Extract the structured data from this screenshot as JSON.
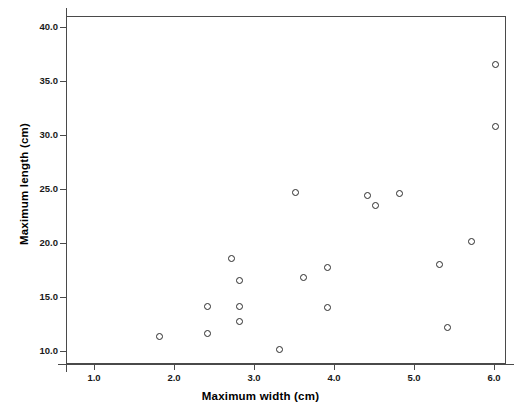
{
  "chart_data": {
    "type": "scatter",
    "title": "",
    "xlabel": "Maximum width (cm)",
    "ylabel": "Maximum length (cm)",
    "xlim": [
      0.65,
      6.15
    ],
    "ylim": [
      8.8,
      41.0
    ],
    "xticks": [
      "1.0",
      "2.0",
      "3.0",
      "4.0",
      "5.0",
      "6.0"
    ],
    "xtick_values": [
      1.0,
      2.0,
      3.0,
      4.0,
      5.0,
      6.0
    ],
    "yticks": [
      "10.0",
      "15.0",
      "20.0",
      "25.0",
      "30.0",
      "35.0",
      "40.0"
    ],
    "ytick_values": [
      10.0,
      15.0,
      20.0,
      25.0,
      30.0,
      35.0,
      40.0
    ],
    "grid": false,
    "legend": null,
    "marker": "open-circle",
    "marker_color": "#2b2b2b",
    "points": [
      {
        "x": 1.8,
        "y": 11.4
      },
      {
        "x": 2.4,
        "y": 14.2
      },
      {
        "x": 2.4,
        "y": 11.7
      },
      {
        "x": 2.7,
        "y": 18.7
      },
      {
        "x": 2.8,
        "y": 16.6
      },
      {
        "x": 2.8,
        "y": 14.2
      },
      {
        "x": 2.8,
        "y": 12.8
      },
      {
        "x": 3.3,
        "y": 10.2
      },
      {
        "x": 3.5,
        "y": 24.8
      },
      {
        "x": 3.6,
        "y": 16.9
      },
      {
        "x": 3.9,
        "y": 17.8
      },
      {
        "x": 3.9,
        "y": 14.1
      },
      {
        "x": 4.4,
        "y": 24.5
      },
      {
        "x": 4.5,
        "y": 23.6
      },
      {
        "x": 4.8,
        "y": 24.7
      },
      {
        "x": 5.3,
        "y": 18.1
      },
      {
        "x": 5.4,
        "y": 12.3
      },
      {
        "x": 5.7,
        "y": 20.2
      },
      {
        "x": 6.0,
        "y": 36.6
      },
      {
        "x": 6.0,
        "y": 30.9
      }
    ]
  },
  "colors": {
    "frame": "#4a4a4a",
    "marker": "#2b2b2b",
    "text": "#000000",
    "background": "#ffffff"
  }
}
